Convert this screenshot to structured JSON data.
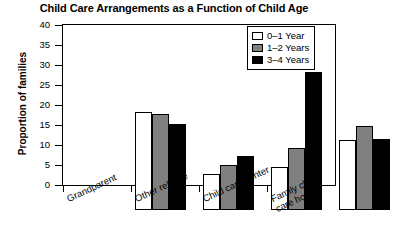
{
  "chart_data": {
    "type": "bar",
    "title": "Child Care Arrangements as a Function of Child Age",
    "xlabel": "",
    "ylabel": "Proportion of families",
    "ylim": [
      0,
      40
    ],
    "yticks": [
      0,
      5,
      10,
      15,
      20,
      25,
      30,
      35,
      40
    ],
    "ytick_labels": [
      "0",
      "5",
      "10",
      "15",
      "20",
      "25",
      "30",
      "35",
      "40"
    ],
    "grid": false,
    "legend_position": "top-right",
    "categories": [
      "Grandparent",
      "Other relative",
      "Child care center",
      "Family child\ncare home"
    ],
    "series": [
      {
        "name": "0–1 Year",
        "color": "#ffffff",
        "values": [
          24.5,
          9.1,
          10.8,
          17.6
        ]
      },
      {
        "name": "1–2 Years",
        "color": "#808080",
        "values": [
          23.9,
          11.3,
          15.6,
          20.9
        ]
      },
      {
        "name": "3–4 Years",
        "color": "#000000",
        "values": [
          21.4,
          13.5,
          34.5,
          17.8
        ]
      }
    ]
  }
}
